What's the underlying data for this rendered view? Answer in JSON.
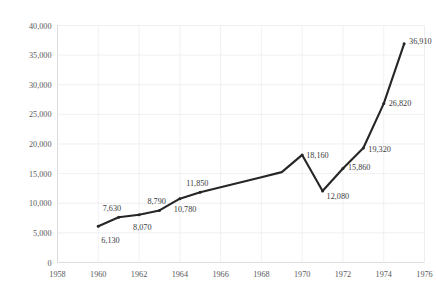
{
  "chart_data": {
    "type": "line",
    "title": "",
    "subtitle": "",
    "xlabel": "",
    "ylabel": "",
    "xlim": [
      1958,
      1976
    ],
    "ylim": [
      0,
      40000
    ],
    "grid": true,
    "legend": "none",
    "x_tick_labels": [
      "1958",
      "1960",
      "1962",
      "1964",
      "1966",
      "1968",
      "1970",
      "1972",
      "1974",
      "1976"
    ],
    "x_ticks": [
      1958,
      1960,
      1962,
      1964,
      1966,
      1968,
      1970,
      1972,
      1974,
      1976
    ],
    "y_tick_labels": [
      "0",
      "5,000",
      "10,000",
      "15,000",
      "20,000",
      "25,000",
      "30,000",
      "35,000",
      "40,000"
    ],
    "y_ticks": [
      0,
      5000,
      10000,
      15000,
      20000,
      25000,
      30000,
      35000,
      40000
    ],
    "x": [
      1960,
      1961,
      1962,
      1963,
      1964,
      1965,
      1966,
      1967,
      1968,
      1969,
      1970,
      1971,
      1972,
      1973,
      1974,
      1975
    ],
    "values": [
      6130,
      7630,
      8070,
      8790,
      10780,
      11850,
      12700,
      13550,
      14400,
      15250,
      18160,
      12080,
      15860,
      19320,
      26820,
      36910
    ],
    "point_labels": [
      {
        "x": 1960,
        "y": 6130,
        "text": "6,130",
        "dx": 3,
        "dy": 17
      },
      {
        "x": 1961,
        "y": 7630,
        "text": "7,630",
        "dx": -16,
        "dy": -6
      },
      {
        "x": 1962,
        "y": 8070,
        "text": "8,070",
        "dx": -6,
        "dy": 15
      },
      {
        "x": 1963,
        "y": 8790,
        "text": "8,790",
        "dx": -12,
        "dy": -6
      },
      {
        "x": 1964,
        "y": 10780,
        "text": "10,780",
        "dx": -6,
        "dy": 13
      },
      {
        "x": 1965,
        "y": 11850,
        "text": "11,850",
        "dx": -14,
        "dy": -6
      },
      {
        "x": 1970,
        "y": 18160,
        "text": "18,160",
        "dx": 4,
        "dy": 3
      },
      {
        "x": 1971,
        "y": 12080,
        "text": "12,080",
        "dx": 4,
        "dy": 8
      },
      {
        "x": 1972,
        "y": 15860,
        "text": "15,860",
        "dx": 5,
        "dy": 1
      },
      {
        "x": 1973,
        "y": 19320,
        "text": "19,320",
        "dx": 5,
        "dy": 4
      },
      {
        "x": 1974,
        "y": 26820,
        "text": "26,820",
        "dx": 5,
        "dy": 2
      },
      {
        "x": 1975,
        "y": 36910,
        "text": "36,910",
        "dx": 5,
        "dy": 0
      }
    ],
    "colors": {
      "line": "#262626",
      "grid": "#e9e9ec",
      "axis_text": "#59595b",
      "label_text": "#3b3b3d",
      "background": "#ffffff"
    }
  }
}
